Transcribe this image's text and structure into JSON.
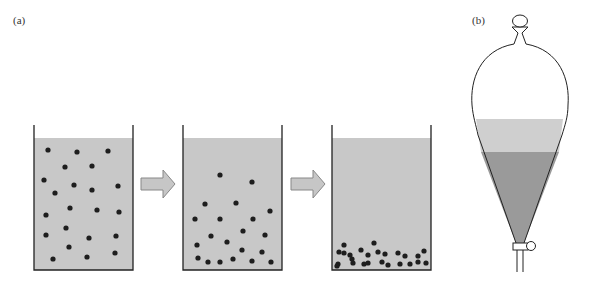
{
  "panels": {
    "a": {
      "label": "(a)"
    },
    "b": {
      "label": "(b)"
    }
  },
  "colors": {
    "liquid": "#c8c8c8",
    "particle": "#1e1e1e",
    "arrow_fill": "#c6c6c6",
    "arrow_stroke": "#888888",
    "glass": "#222222",
    "upper_layer": "#cfcfcf",
    "lower_layer": "#9a9a9a"
  },
  "beakers": [
    {
      "name": "beaker-suspended",
      "particles": [
        [
          48,
          150
        ],
        [
          77,
          152
        ],
        [
          108,
          151
        ],
        [
          65,
          167
        ],
        [
          92,
          166
        ],
        [
          44,
          180
        ],
        [
          74,
          185
        ],
        [
          92,
          190
        ],
        [
          118,
          186
        ],
        [
          55,
          193
        ],
        [
          70,
          208
        ],
        [
          97,
          210
        ],
        [
          119,
          212
        ],
        [
          46,
          215
        ],
        [
          66,
          228
        ],
        [
          89,
          238
        ],
        [
          116,
          236
        ],
        [
          46,
          235
        ],
        [
          69,
          247
        ],
        [
          87,
          257
        ],
        [
          115,
          253
        ],
        [
          53,
          259
        ]
      ]
    },
    {
      "name": "beaker-settling",
      "particles": [
        [
          220,
          175
        ],
        [
          252,
          182
        ],
        [
          205,
          204
        ],
        [
          236,
          203
        ],
        [
          270,
          211
        ],
        [
          195,
          219
        ],
        [
          220,
          219
        ],
        [
          253,
          219
        ],
        [
          243,
          231
        ],
        [
          211,
          236
        ],
        [
          265,
          235
        ],
        [
          197,
          245
        ],
        [
          227,
          242
        ],
        [
          242,
          250
        ],
        [
          262,
          252
        ],
        [
          198,
          258
        ],
        [
          208,
          262
        ],
        [
          220,
          262
        ],
        [
          233,
          259
        ],
        [
          252,
          261
        ],
        [
          271,
          262
        ]
      ]
    },
    {
      "name": "beaker-settled",
      "particles": [
        [
          344,
          245
        ],
        [
          374,
          243
        ],
        [
          339,
          252
        ],
        [
          350,
          255
        ],
        [
          361,
          250
        ],
        [
          338,
          264
        ],
        [
          352,
          259
        ],
        [
          368,
          255
        ],
        [
          378,
          252
        ],
        [
          385,
          254
        ],
        [
          398,
          253
        ],
        [
          405,
          256
        ],
        [
          418,
          256
        ],
        [
          424,
          251
        ],
        [
          337,
          266
        ],
        [
          353,
          263
        ],
        [
          368,
          263
        ],
        [
          382,
          262
        ],
        [
          388,
          265
        ],
        [
          400,
          264
        ],
        [
          410,
          264
        ],
        [
          418,
          262
        ],
        [
          426,
          263
        ],
        [
          364,
          264
        ],
        [
          344,
          253
        ]
      ]
    }
  ],
  "arrows": [
    {
      "name": "arrow-1",
      "x": 141,
      "y": 184
    },
    {
      "name": "arrow-2",
      "x": 291,
      "y": 184
    }
  ]
}
